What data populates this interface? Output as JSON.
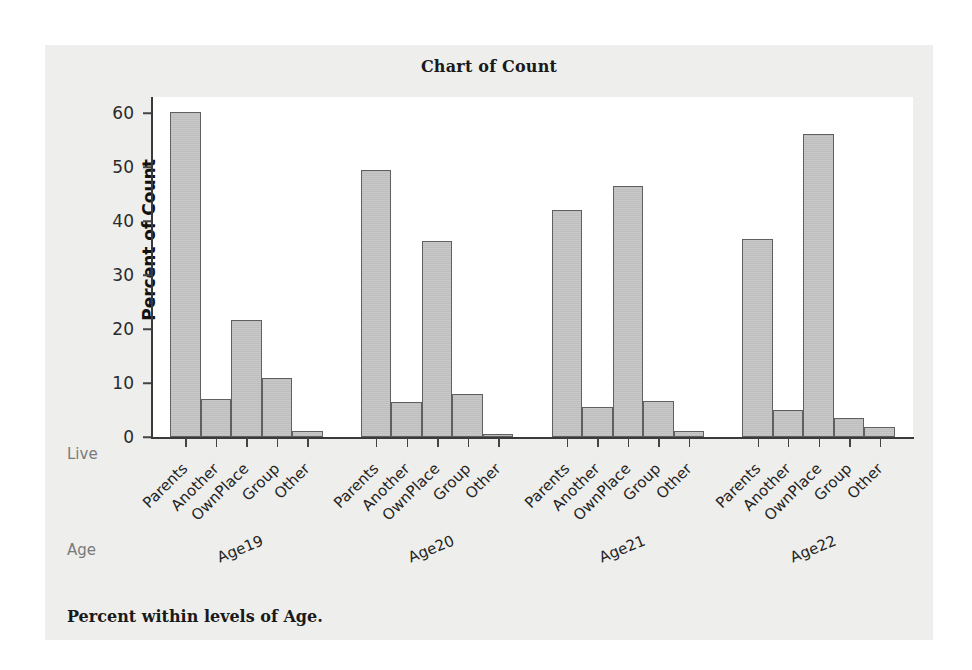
{
  "figure": {
    "title": "Chart of Count",
    "footnote": "Percent within levels of Age.",
    "panel_bg": "#eeeeec",
    "plot_bg": "#ffffff",
    "bar_fill": "#c6c6c6",
    "bar_edge": "#606060",
    "axis_color": "#3a3a3a",
    "row_label_color": "#7a7a7a"
  },
  "row_labels": {
    "live": "Live",
    "age": "Age"
  },
  "chart_data": {
    "type": "bar",
    "title": "Chart of Count",
    "xlabel": "",
    "ylabel": "Percent of Count",
    "ylim": [
      0,
      63
    ],
    "yticks": [
      0,
      10,
      20,
      30,
      40,
      50,
      60
    ],
    "ytick_labels": [
      "0",
      "10",
      "20",
      "30",
      "40",
      "50",
      "60"
    ],
    "grid": false,
    "legend": "none",
    "grouping": [
      "Age",
      "Live"
    ],
    "categories": [
      "Parents",
      "Another",
      "OwnPlace",
      "Group",
      "Other"
    ],
    "groups": [
      "Age19",
      "Age20",
      "Age21",
      "Age22"
    ],
    "series": [
      {
        "name": "Age19",
        "values": [
          60.3,
          7.0,
          21.6,
          10.9,
          1.2
        ]
      },
      {
        "name": "Age20",
        "values": [
          49.4,
          6.5,
          36.4,
          8.0,
          0.5
        ]
      },
      {
        "name": "Age21",
        "values": [
          42.1,
          5.5,
          46.6,
          6.6,
          1.1
        ]
      },
      {
        "name": "Age22",
        "values": [
          36.7,
          5.0,
          56.2,
          3.6,
          1.8
        ]
      }
    ],
    "annotation": "Percent within levels of Age."
  }
}
